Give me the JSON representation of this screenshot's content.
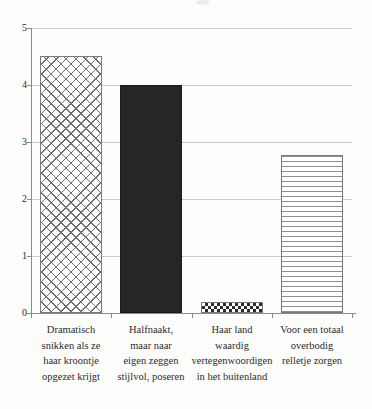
{
  "chart_data": {
    "type": "bar",
    "title": "",
    "subtitle": "",
    "xlabel": "",
    "ylabel": "",
    "ylim": [
      0,
      5
    ],
    "yticks": [
      "0",
      "1",
      "2",
      "3",
      "4",
      "5"
    ],
    "grid": true,
    "legend": "none",
    "categories": [
      "Dramatisch snikken als ze haar kroontje opgezet krijgt",
      "Halfnaakt, maar naar eigen zeggen stijlvol, poseren",
      "Haar land waardig vertegenwoordigen in het buitenland",
      "Voor een totaal overbodig relletje zorgen"
    ],
    "values": [
      4.5,
      4.0,
      0.19,
      2.78
    ]
  },
  "axis": {
    "y_ticks": [
      {
        "label": "5",
        "value": 5
      },
      {
        "label": "4",
        "value": 4
      },
      {
        "label": "3",
        "value": 3
      },
      {
        "label": "2",
        "value": 2
      },
      {
        "label": "1",
        "value": 1
      },
      {
        "label": "0",
        "value": 0
      }
    ]
  },
  "bars": [
    {
      "label_lines": [
        "Dramatisch",
        "snikken als ze",
        "haar kroontje",
        "opgezet krijgt"
      ],
      "value": 4.5,
      "pattern": "diagonal-crosshatch",
      "color": "#6f6f6f"
    },
    {
      "label_lines": [
        "Halfnaakt,",
        "maar naar",
        "eigen zeggen",
        "stijlvol, poseren"
      ],
      "value": 4.0,
      "pattern": "solid-dark",
      "color": "#262626"
    },
    {
      "label_lines": [
        "Haar land",
        "waardig",
        "vertegenwoordigen",
        "in het buitenland"
      ],
      "value": 0.19,
      "pattern": "checkerboard",
      "color": "#2b2b2b"
    },
    {
      "label_lines": [
        "Voor een totaal",
        "overbodig",
        "relletje zorgen"
      ],
      "value": 2.78,
      "pattern": "horizontal-stripes",
      "color": "#8f8f8f"
    }
  ],
  "style": {
    "background": "#fdfdfc",
    "gridline_color": "#c9c9c9",
    "axis_color": "#8a8a8a",
    "text_color": "#2b2b2b"
  }
}
